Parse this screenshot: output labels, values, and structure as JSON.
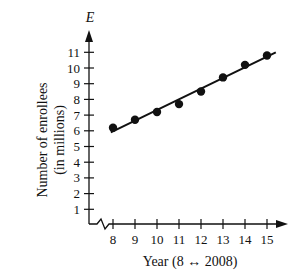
{
  "chart_data": {
    "type": "scatter",
    "title": "",
    "xlabel": "Year (8 ↔ 2008)",
    "ylabel": "Number of enrollees (in millions)",
    "ylabel_lines": [
      "Number of enrollees",
      "(in millions)"
    ],
    "y_axis_variable": "E",
    "x": [
      8,
      9,
      10,
      11,
      12,
      13,
      14,
      15
    ],
    "values": [
      6.2,
      6.7,
      7.2,
      7.7,
      8.5,
      9.4,
      10.2,
      10.8
    ],
    "trend_line": {
      "x": [
        7.9,
        15.4
      ],
      "y": [
        5.9,
        11.0
      ]
    },
    "x_ticks": [
      "8",
      "9",
      "10",
      "11",
      "12",
      "13",
      "14",
      "15"
    ],
    "y_ticks": [
      "1",
      "2",
      "3",
      "4",
      "5",
      "6",
      "7",
      "8",
      "9",
      "10",
      "11"
    ],
    "xlim": [
      7,
      15.5
    ],
    "ylim": [
      0,
      12
    ],
    "grid": false,
    "axis_break": true,
    "legend": null,
    "colors": {
      "ink": "#111111",
      "background": "#ffffff"
    }
  }
}
